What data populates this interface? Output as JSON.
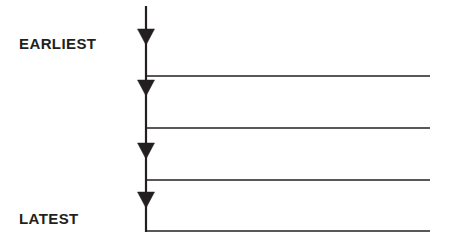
{
  "diagram": {
    "labels": {
      "earliest": "EARLIEST",
      "latest": "LATEST"
    },
    "colors": {
      "stroke": "#231f20",
      "background": "#ffffff"
    },
    "axis": {
      "orientation": "vertical",
      "x": 146,
      "y_start": 6,
      "y_end": 232,
      "stroke_width": 2.2,
      "direction": "downward"
    },
    "markers": [
      {
        "name": "arrow-1",
        "x": 146,
        "tip_y": 45,
        "width": 17,
        "height": 16
      },
      {
        "name": "arrow-2",
        "x": 146,
        "tip_y": 96,
        "width": 17,
        "height": 16
      },
      {
        "name": "arrow-3",
        "x": 146,
        "tip_y": 159,
        "width": 17,
        "height": 16
      },
      {
        "name": "arrow-4",
        "x": 146,
        "tip_y": 208,
        "width": 17,
        "height": 16
      }
    ],
    "event_lines": [
      {
        "name": "event-line-1",
        "y": 76,
        "x_start": 146,
        "x_end": 430,
        "stroke_width": 1.5
      },
      {
        "name": "event-line-2",
        "y": 128,
        "x_start": 146,
        "x_end": 430,
        "stroke_width": 1.5
      },
      {
        "name": "event-line-3",
        "y": 180,
        "x_start": 146,
        "x_end": 430,
        "stroke_width": 1.5
      },
      {
        "name": "event-line-4",
        "y": 231,
        "x_start": 146,
        "x_end": 430,
        "stroke_width": 1.5
      }
    ]
  }
}
